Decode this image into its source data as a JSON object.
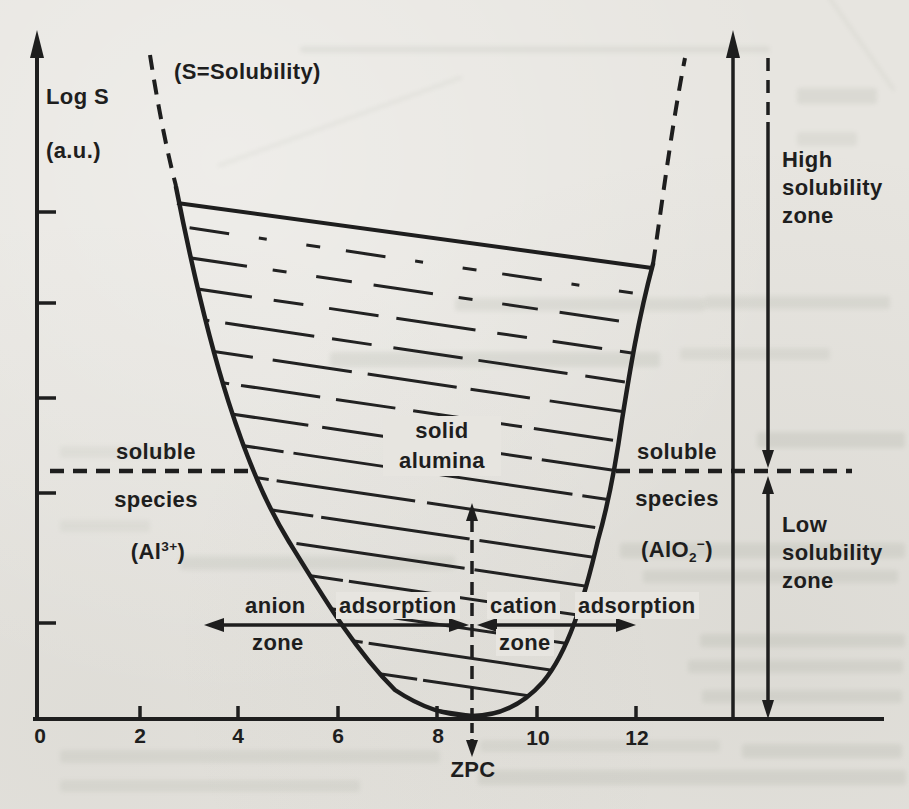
{
  "figure": {
    "title_note": "(S=Solubility)",
    "y_axis": {
      "label_line1": "Log S",
      "label_line2": "(a.u.)"
    },
    "x_axis": {
      "tick_labels": [
        "0",
        "2",
        "4",
        "6",
        "8",
        "10",
        "12"
      ],
      "zpc_label": "ZPC"
    },
    "zones": {
      "high": "High solubility zone",
      "low": "Low solubility zone",
      "anion": {
        "w1": "anion",
        "w2": "adsorption",
        "w3": "zone"
      },
      "cation": {
        "w1": "cation",
        "w2": "adsorption",
        "w3": "zone"
      }
    },
    "species": {
      "left": {
        "l1": "soluble",
        "l2": "species",
        "f_pre": "(Al",
        "f_sup": "3+",
        "f_post": ")"
      },
      "right": {
        "l1": "soluble",
        "l2": "species",
        "f_pre": "(AlO",
        "f_sub": "2",
        "f_sup": "−",
        "f_post": ")"
      },
      "solid": "solid alumina"
    },
    "colors": {
      "ink": "#1e1e1e",
      "paper": "#e7e5e0"
    }
  }
}
